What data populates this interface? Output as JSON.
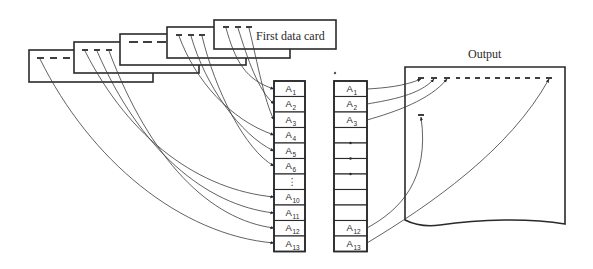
{
  "diagram": {
    "first_card_label": "First data card",
    "output_label": "Output",
    "colors": {
      "ink": "#2a2a2a",
      "background": "#ffffff"
    },
    "cards": [
      {
        "id": "card-5",
        "x": 29,
        "y": 50,
        "w": 124,
        "h": 32,
        "marks": "dashes-3"
      },
      {
        "id": "card-4",
        "x": 74,
        "y": 42,
        "w": 125,
        "h": 31,
        "marks": "ticks-3"
      },
      {
        "id": "card-3",
        "x": 120,
        "y": 34,
        "w": 126,
        "h": 31,
        "marks": "dashes-3"
      },
      {
        "id": "card-2",
        "x": 167,
        "y": 27,
        "w": 123,
        "h": 31,
        "marks": "ticks-3"
      },
      {
        "id": "card-1",
        "x": 214,
        "y": 20,
        "w": 122,
        "h": 29,
        "marks": "ticks-3",
        "label": "First data card"
      }
    ],
    "input_array": {
      "cells": [
        {
          "base": "A",
          "sub": "1"
        },
        {
          "base": "A",
          "sub": "2"
        },
        {
          "base": "A",
          "sub": "3"
        },
        {
          "base": "A",
          "sub": "4"
        },
        {
          "base": "A",
          "sub": "5"
        },
        {
          "base": "A",
          "sub": "6"
        },
        {
          "base": "⋮",
          "sub": ""
        },
        {
          "base": "A",
          "sub": "10"
        },
        {
          "base": "A",
          "sub": "11"
        },
        {
          "base": "A",
          "sub": "12"
        },
        {
          "base": "A",
          "sub": "13"
        }
      ]
    },
    "output_array": {
      "cells": [
        {
          "base": "A",
          "sub": "1"
        },
        {
          "base": "A",
          "sub": "2"
        },
        {
          "base": "A",
          "sub": "3"
        },
        {
          "base": "",
          "sub": ""
        },
        {
          "base": "",
          "sub": ""
        },
        {
          "base": "",
          "sub": ""
        },
        {
          "base": "",
          "sub": ""
        },
        {
          "base": "",
          "sub": ""
        },
        {
          "base": "",
          "sub": ""
        },
        {
          "base": "A",
          "sub": "12"
        },
        {
          "base": "A",
          "sub": "13"
        }
      ]
    }
  }
}
